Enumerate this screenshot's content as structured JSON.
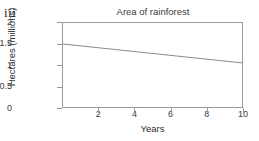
{
  "figure": {
    "index_label": "iii"
  },
  "chart_data": {
    "type": "line",
    "title": "Area of rainforest",
    "xlabel": "Years",
    "ylabel": "Hectares (millions)",
    "xlim": [
      0,
      10
    ],
    "ylim": [
      0,
      2
    ],
    "grid": false,
    "legend": null,
    "x_ticks": [
      {
        "value": 2,
        "label": "2"
      },
      {
        "value": 4,
        "label": "4"
      },
      {
        "value": 6,
        "label": "6"
      },
      {
        "value": 8,
        "label": "8"
      },
      {
        "value": 10,
        "label": "10"
      }
    ],
    "y_ticks": [
      {
        "value": 0,
        "label": "0"
      },
      {
        "value": 0.5,
        "label": "0.5"
      },
      {
        "value": 1,
        "label": "1"
      },
      {
        "value": 1.5,
        "label": "1.5"
      },
      {
        "value": 2,
        "label": "2"
      }
    ],
    "series": [
      {
        "name": "Area of rainforest",
        "color": "#8a8a8a",
        "x": [
          0,
          10
        ],
        "values": [
          1.5,
          1.05
        ]
      }
    ]
  },
  "style": {
    "axis_color": "#9a9a9a",
    "text_color": "#3b3b3b",
    "background": "#ffffff"
  }
}
